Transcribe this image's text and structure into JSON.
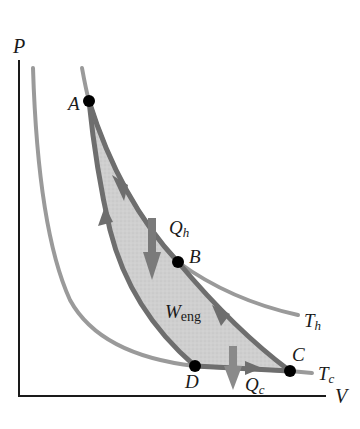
{
  "diagram": {
    "type": "PV diagram - Carnot cycle",
    "axes": {
      "y_label": "P",
      "x_label": "V"
    },
    "isotherms": [
      {
        "name": "T_h",
        "label_main": "T",
        "label_sub": "h"
      },
      {
        "name": "T_c",
        "label_main": "T",
        "label_sub": "c"
      }
    ],
    "points": [
      {
        "id": "A",
        "label": "A"
      },
      {
        "id": "B",
        "label": "B"
      },
      {
        "id": "C",
        "label": "C"
      },
      {
        "id": "D",
        "label": "D"
      }
    ],
    "heat_flows": [
      {
        "id": "Q_h",
        "label_main": "Q",
        "label_sub": "h",
        "direction": "into gas"
      },
      {
        "id": "Q_c",
        "label_main": "Q",
        "label_sub": "c",
        "direction": "out of gas"
      }
    ],
    "work": {
      "label_main": "W",
      "label_sub": "eng"
    },
    "colors": {
      "axis": "#1a1a1a",
      "isotherm": "#9a9a9a",
      "cycle_path": "#6e6e6e",
      "cycle_fill": "#cfcfcf",
      "point": "#000000",
      "heat_arrow": "#7a7a7a"
    }
  }
}
